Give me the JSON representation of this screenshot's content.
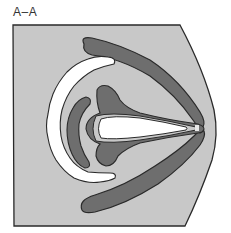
{
  "diagram": {
    "section_label": "A–A",
    "colors": {
      "background": "#ffffff",
      "section_fill": "#c8c8c8",
      "dark_region": "#6e6e6e",
      "light_region": "#ffffff",
      "outline": "#2a2a2a"
    },
    "regions": [
      {
        "name": "section-boundary",
        "fill": "section_fill"
      },
      {
        "name": "upper-dark-arm",
        "fill": "dark_region"
      },
      {
        "name": "lower-dark-arm",
        "fill": "dark_region"
      },
      {
        "name": "outer-white-crescent",
        "fill": "light_region"
      },
      {
        "name": "inner-dark-crescent",
        "fill": "dark_region"
      },
      {
        "name": "central-arrow-dark",
        "fill": "dark_region"
      },
      {
        "name": "central-white-core",
        "fill": "light_region"
      }
    ]
  }
}
